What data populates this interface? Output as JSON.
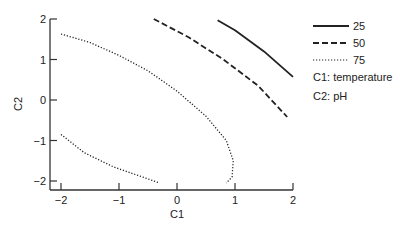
{
  "chart_data": {
    "type": "line",
    "title": "",
    "xlabel": "C1",
    "ylabel": "C2",
    "xlim": [
      -2,
      2
    ],
    "ylim": [
      -2,
      2
    ],
    "xticks": [
      "-2",
      "-1",
      "0",
      "1",
      "2"
    ],
    "yticks": [
      "2",
      "1",
      "0",
      "-1",
      "-2"
    ],
    "grid": false,
    "legend_position": "right",
    "series": [
      {
        "name": "25",
        "style": "solid",
        "points": [
          [
            0.7,
            1.97
          ],
          [
            1.0,
            1.72
          ],
          [
            1.5,
            1.2
          ],
          [
            2.0,
            0.57
          ]
        ]
      },
      {
        "name": "50",
        "style": "dashed",
        "points": [
          [
            -0.4,
            2.0
          ],
          [
            0.2,
            1.55
          ],
          [
            0.8,
            1.0
          ],
          [
            1.4,
            0.35
          ],
          [
            1.9,
            -0.42
          ]
        ]
      },
      {
        "name": "75",
        "style": "dotted",
        "segment": "upper",
        "points": [
          [
            -2.0,
            1.63
          ],
          [
            -1.5,
            1.42
          ],
          [
            -1.0,
            1.1
          ],
          [
            -0.5,
            0.72
          ],
          [
            0.0,
            0.22
          ],
          [
            0.5,
            -0.4
          ],
          [
            0.85,
            -1.0
          ],
          [
            0.97,
            -1.5
          ],
          [
            0.95,
            -1.9
          ],
          [
            0.85,
            -2.05
          ]
        ]
      },
      {
        "name": "75",
        "style": "dotted",
        "segment": "lower",
        "points": [
          [
            -2.0,
            -0.85
          ],
          [
            -1.6,
            -1.3
          ],
          [
            -1.1,
            -1.65
          ],
          [
            -0.6,
            -1.9
          ],
          [
            -0.3,
            -2.05
          ]
        ]
      }
    ],
    "annotations": [
      "C1: temperature",
      "C2: pH"
    ]
  },
  "legend": {
    "items": [
      {
        "label": "25",
        "style": "solid"
      },
      {
        "label": "50",
        "style": "dashed"
      },
      {
        "label": "75",
        "style": "dotted"
      }
    ],
    "notes": [
      "C1: temperature",
      "C2: pH"
    ]
  }
}
